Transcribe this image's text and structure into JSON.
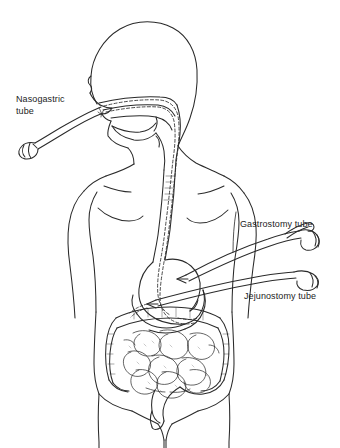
{
  "figure": {
    "type": "medical-line-illustration",
    "background_color": "#ffffff",
    "line_color": "#2a2a2a",
    "text_color": "#1c1c1c"
  },
  "labels": {
    "nasogastric": "Nasogastric\ntube",
    "gastrostomy": "Gastrostomy tube",
    "jejunostomy": "Jejunostomy tube"
  },
  "anatomy_parts": [
    "head-profile",
    "nasal-passage",
    "mouth-and-tongue",
    "pharynx",
    "neck",
    "torso",
    "left-arm",
    "right-arm",
    "esophagus",
    "stomach",
    "duodenum",
    "small-intestine",
    "large-intestine",
    "pelvis",
    "legs"
  ],
  "tubes": [
    {
      "name": "nasogastric-tube",
      "label": "Nasogastric\ntube",
      "entry": "nose",
      "route": "nasal passage to pharynx to esophagus to stomach",
      "rendering": "dashed-line",
      "external_end": "connector-clamp"
    },
    {
      "name": "gastrostomy-tube",
      "label": "Gastrostomy tube",
      "entry": "abdominal wall",
      "route": "through abdominal wall into stomach body",
      "rendering": "solid-double-line",
      "external_end": "funnel-connector"
    },
    {
      "name": "jejunostomy-tube",
      "label": "Jejunostomy tube",
      "entry": "abdominal wall",
      "route": "through abdominal wall into jejunum",
      "rendering": "solid-double-line",
      "external_end": "funnel-connector"
    }
  ]
}
